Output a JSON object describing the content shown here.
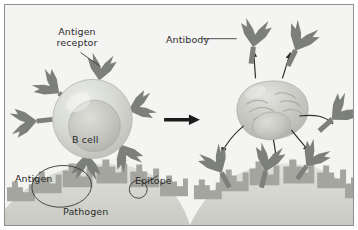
{
  "figure": {
    "panels": [
      {
        "name": "left-panel",
        "description": "B cell with antigen receptors binding pathogen surface antigens"
      },
      {
        "name": "right-panel",
        "description": "Plasma cell secreting antibodies onto pathogen surface"
      }
    ]
  },
  "labels": {
    "antigen_receptor": "Antigen receptor",
    "antibody": "Antibody",
    "b_cell": "B cell",
    "antigen": "Antigen",
    "epitope": "Epitope",
    "pathogen": "Pathogen"
  },
  "icons": {
    "transition_arrow": "arrow-right-icon",
    "secretion_arrow": "curved-arrow-icon",
    "antibody_shape": "y-shaped-antibody-icon",
    "receptor_shape": "y-shaped-receptor-icon",
    "antigen_callout": "ellipse-callout-icon",
    "epitope_callout": "circle-callout-icon",
    "leader_line": "leader-line-icon"
  },
  "colors": {
    "background": "#f4f4f2",
    "frame_border": "#8d8f8c",
    "antibody_gray": "#7c7f7a",
    "antibody_gray_dark": "#6a6d68",
    "cell_body": "#cdcfc9",
    "cell_body_light": "#e2e3de",
    "nucleus": "#bdbfb8",
    "pathogen_body": "#d6d7d1",
    "antigen_spike": "#a3a59e",
    "arrow_black": "#1b1b1b",
    "label_text": "#2b2b2b",
    "callout_stroke": "#3a3a3a"
  },
  "counts": {
    "b_cell_receptors": 6,
    "secreted_antibodies_right": 6,
    "secretion_arrows": 5
  }
}
